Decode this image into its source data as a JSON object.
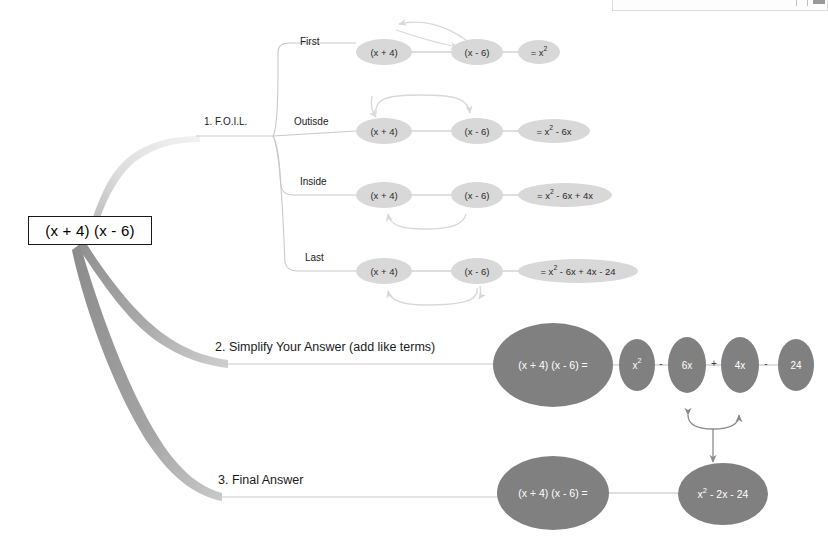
{
  "document": {
    "title": "FOIL Method Mind Map",
    "root_expression": "(x + 4) (x - 6)"
  },
  "topbar": {
    "present": true,
    "description": "partial-window-toolbar-strip"
  },
  "colors": {
    "background": "#ffffff",
    "foil_node_fill": "#d8d8d8",
    "foil_node_text": "#2a2a2a",
    "dark_node_fill": "#808080",
    "dark_node_text": "#ffffff",
    "connector": "#bdbdbd",
    "branch_ribbon_light": "#e2e2e2",
    "branch_ribbon_mid": "#a8a8a8",
    "branch_ribbon_dark": "#9b9b9b",
    "curve_arrow": "#d8d8d8",
    "gray_arrow": "#8a8a8a",
    "root_border": "#1a1a1a"
  },
  "branches": [
    {
      "id": "foil",
      "label": "1. F.O.I.L.",
      "sub_branches": [
        {
          "id": "first",
          "label": "First",
          "nodes": [
            "(x + 4)",
            "(x - 6)",
            "= x²"
          ],
          "node_plain": [
            "(x + 4)",
            "(x - 6)",
            "= x2"
          ],
          "result_base": "= x",
          "result_sup": "2",
          "result_tail": "",
          "arrow": "top-diagonal"
        },
        {
          "id": "outside",
          "label": "Outisde",
          "nodes": [
            "(x + 4)",
            "(x - 6)",
            "= x² - 6x"
          ],
          "node_plain": [
            "(x + 4)",
            "(x - 6)",
            "= x2 - 6x"
          ],
          "result_base": "= x",
          "result_sup": "2",
          "result_tail": " - 6x",
          "arrow": "over-top"
        },
        {
          "id": "inside",
          "label": "Inside",
          "nodes": [
            "(x + 4)",
            "(x - 6)",
            "= x² - 6x + 4x"
          ],
          "node_plain": [
            "(x + 4)",
            "(x - 6)",
            "= x2 - 6x + 4x"
          ],
          "result_base": "= x",
          "result_sup": "2",
          "result_tail": " - 6x + 4x",
          "arrow": "under-u-short"
        },
        {
          "id": "last",
          "label": "Last",
          "nodes": [
            "(x + 4)",
            "(x - 6)",
            "= x² - 6x + 4x - 24"
          ],
          "node_plain": [
            "(x + 4)",
            "(x - 6)",
            "= x2 - 6x + 4x - 24"
          ],
          "result_base": "= x",
          "result_sup": "2",
          "result_tail": " - 6x + 4x - 24",
          "arrow": "under-u-long"
        }
      ]
    },
    {
      "id": "simplify",
      "label": "2. Simplify Your Answer (add like terms)",
      "lead_node": "(x + 4) (x - 6) =",
      "terms": [
        {
          "value": "x²",
          "base": "x",
          "sup": "2",
          "op_before": ""
        },
        {
          "value": "6x",
          "base": "6x",
          "sup": "",
          "op_before": "-"
        },
        {
          "value": "4x",
          "base": "4x",
          "sup": "",
          "op_before": "+"
        },
        {
          "value": "24",
          "base": "24",
          "sup": "",
          "op_before": "-"
        }
      ]
    },
    {
      "id": "final",
      "label": "3. Final Answer",
      "lead_node": "(x + 4) (x - 6) =",
      "result_node": "x² - 2x - 24",
      "result_base": "x",
      "result_sup": "2",
      "result_tail": " - 2x - 24"
    }
  ]
}
